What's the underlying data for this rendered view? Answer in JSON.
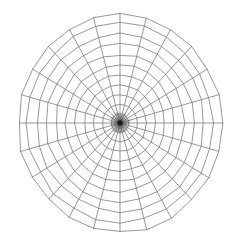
{
  "figure": {
    "type": "polar-mesh",
    "background_color": "#ffffff",
    "line_color": "#6f6f6f",
    "center_color": "#1a1a1a"
  },
  "chart_data": {
    "type": "polar-grid",
    "title": "",
    "subtitle": "",
    "xlabel": "",
    "ylabel": "",
    "grid": true,
    "legend": false,
    "legend_position": "none",
    "center_x": 120,
    "center_y": 123,
    "radius_x": 102,
    "radius_y": 109,
    "spoke_count": 24,
    "spoke_step_degrees": 15,
    "ring_count": 11,
    "spoke_angles_degrees": [
      0,
      15,
      30,
      45,
      60,
      75,
      90,
      105,
      120,
      135,
      150,
      165,
      180,
      195,
      210,
      225,
      240,
      255,
      270,
      285,
      300,
      315,
      330,
      345
    ],
    "ring_radii_fraction": [
      0.085,
      0.17,
      0.258,
      0.348,
      0.44,
      0.533,
      0.628,
      0.723,
      0.818,
      0.912,
      1.0
    ],
    "ring_labels": [
      "",
      "",
      "",
      "",
      "",
      "",
      "",
      "",
      "",
      "",
      ""
    ],
    "tick_labels": [],
    "annotations": [],
    "wobble_amplitude": 0.016,
    "stroke_width": 0.72
  }
}
